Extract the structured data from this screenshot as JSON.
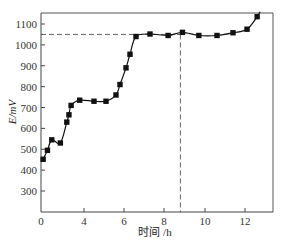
{
  "chart_data": {
    "type": "line",
    "title": "",
    "xlabel": "时间 /h",
    "ylabel": "E/mV",
    "xlim": [
      0,
      13.5
    ],
    "ylim": [
      200,
      1150
    ],
    "grid": false,
    "legend": null,
    "x_ticks": [
      0,
      4,
      6,
      8,
      10,
      12
    ],
    "x_tick_labels": [
      "0",
      "4",
      "6",
      "8",
      "10",
      "12"
    ],
    "y_ticks": [
      300,
      400,
      500,
      600,
      700,
      800,
      900,
      1000,
      1100
    ],
    "y_tick_labels": [
      "300",
      "400",
      "500",
      "600",
      "700",
      "800",
      "900",
      "1000",
      "1100"
    ],
    "series": [
      {
        "name": "E",
        "marker": "square",
        "x": [
          0.2,
          0.6,
          1.0,
          1.8,
          2.4,
          2.6,
          2.8,
          3.6,
          4.5,
          5.1,
          5.6,
          5.8,
          6.1,
          6.3,
          6.6,
          7.3,
          8.2,
          8.9,
          9.7,
          10.6,
          11.4,
          12.1,
          12.6
        ],
        "values": [
          452,
          495,
          545,
          530,
          630,
          665,
          710,
          735,
          730,
          730,
          760,
          810,
          890,
          955,
          1040,
          1052,
          1045,
          1060,
          1045,
          1045,
          1058,
          1075,
          1135
        ]
      }
    ],
    "annotations": [
      {
        "type": "dashed-hline",
        "y": 1050,
        "x_from": 0,
        "x_to": 8.8
      },
      {
        "type": "dashed-vline",
        "x": 8.8,
        "y_from": 200,
        "y_to": 1050
      }
    ]
  }
}
